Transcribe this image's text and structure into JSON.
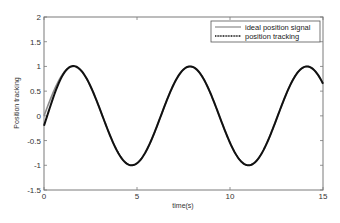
{
  "chart_data": {
    "type": "line",
    "title": "",
    "xlabel": "time(s)",
    "ylabel": "Position tracking",
    "xlim": [
      0,
      15
    ],
    "ylim": [
      -1.5,
      2
    ],
    "xticks": [
      0,
      5,
      10,
      15
    ],
    "yticks": [
      -1.5,
      -1,
      -0.5,
      0,
      0.5,
      1,
      1.5,
      2
    ],
    "ytick_labels": [
      "-1.5",
      "-1",
      "-0.5",
      "0",
      "0.5",
      "1",
      "1.5",
      "2"
    ],
    "xtick_labels": [
      "0",
      "5",
      "10",
      "15"
    ],
    "grid": false,
    "legend_position": "upper right",
    "series": [
      {
        "name": "ideal position signal",
        "style": "solid",
        "color": "#8a8a8a",
        "function": "sin(t)",
        "x": [
          0,
          0.5,
          1,
          1.571,
          2,
          3,
          4,
          4.712,
          5,
          6,
          7,
          7.854,
          9,
          10,
          10.996,
          12,
          13,
          14.137,
          15
        ],
        "values": [
          0,
          0.48,
          0.84,
          1,
          0.91,
          0.14,
          -0.76,
          -1,
          -0.96,
          -0.28,
          0.66,
          1,
          0.41,
          -0.54,
          -1,
          -0.54,
          0.42,
          1,
          0.65
        ]
      },
      {
        "name": "position tracking",
        "style": "dotted-thick",
        "color": "#111111",
        "x": [
          0,
          0.25,
          0.5,
          1,
          1.571,
          2,
          3,
          4,
          4.712,
          5,
          6,
          7,
          7.854,
          9,
          10,
          10.996,
          12,
          13,
          14.137,
          15
        ],
        "values": [
          -0.2,
          -0.08,
          0.3,
          0.75,
          0.99,
          0.91,
          0.14,
          -0.76,
          -1,
          -0.96,
          -0.28,
          0.66,
          1,
          0.41,
          -0.54,
          -1,
          -0.54,
          0.42,
          1,
          0.65
        ]
      }
    ]
  },
  "legend": {
    "items": [
      {
        "label": "ideal position signal"
      },
      {
        "label": "position tracking"
      }
    ]
  }
}
